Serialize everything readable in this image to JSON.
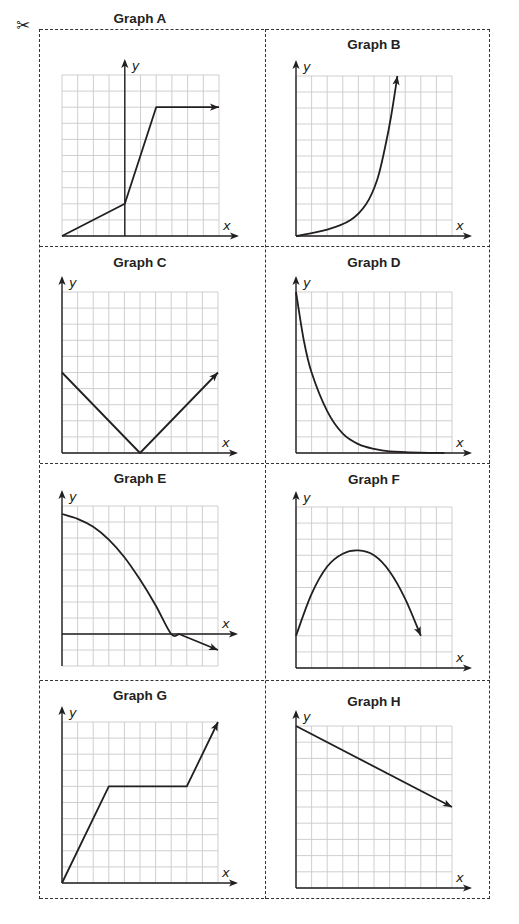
{
  "worksheet": {
    "cut_icon": "scissors-icon",
    "scissors_glyph": "✂",
    "colors": {
      "grid": "#c9c9c9",
      "axis": "#231f20",
      "curve": "#231f20",
      "cut_line": "#333333"
    }
  },
  "cards": [
    {
      "id": "A",
      "title": "Graph A",
      "x_label": "x",
      "y_label": "y"
    },
    {
      "id": "B",
      "title": "Graph B",
      "x_label": "x",
      "y_label": "y"
    },
    {
      "id": "C",
      "title": "Graph C",
      "x_label": "x",
      "y_label": "y"
    },
    {
      "id": "D",
      "title": "Graph D",
      "x_label": "x",
      "y_label": "y"
    },
    {
      "id": "E",
      "title": "Graph E",
      "x_label": "x",
      "y_label": "y"
    },
    {
      "id": "F",
      "title": "Graph F",
      "x_label": "x",
      "y_label": "y"
    },
    {
      "id": "G",
      "title": "Graph G",
      "x_label": "x",
      "y_label": "y"
    },
    {
      "id": "H",
      "title": "Graph H",
      "x_label": "x",
      "y_label": "y"
    }
  ],
  "chart_data": [
    {
      "title": "Graph A",
      "type": "line",
      "grid": {
        "cols": 10,
        "rows": 10
      },
      "y_axis_at_col": 4,
      "x_axis_at_row": 0,
      "points": [
        [
          0,
          0
        ],
        [
          4,
          2
        ],
        [
          6,
          8
        ],
        [
          10,
          8
        ]
      ],
      "arrow_end": true,
      "xlabel": "x",
      "ylabel": "y"
    },
    {
      "title": "Graph B",
      "type": "line",
      "shape": "exponential growth",
      "grid": {
        "cols": 10,
        "rows": 10
      },
      "y_axis_at_col": 0,
      "x_axis_at_row": 0,
      "points": [
        [
          0,
          0
        ],
        [
          2,
          0.4
        ],
        [
          3.5,
          1
        ],
        [
          4.5,
          2
        ],
        [
          5.2,
          3.5
        ],
        [
          5.7,
          5.5
        ],
        [
          6.1,
          7.5
        ],
        [
          6.5,
          10
        ]
      ],
      "arrow_end": true,
      "xlabel": "x",
      "ylabel": "y"
    },
    {
      "title": "Graph C",
      "type": "line",
      "shape": "absolute value (V)",
      "grid": {
        "cols": 10,
        "rows": 10
      },
      "y_axis_at_col": 0,
      "x_axis_at_row": 0,
      "points": [
        [
          0,
          5
        ],
        [
          5,
          0
        ],
        [
          10,
          5
        ]
      ],
      "arrow_end": true,
      "xlabel": "x",
      "ylabel": "y"
    },
    {
      "title": "Graph D",
      "type": "line",
      "shape": "exponential decay",
      "grid": {
        "cols": 10,
        "rows": 10
      },
      "y_axis_at_col": 0,
      "x_axis_at_row": 0,
      "points": [
        [
          0,
          10
        ],
        [
          0.5,
          7
        ],
        [
          1,
          5
        ],
        [
          2,
          2.6
        ],
        [
          3,
          1.2
        ],
        [
          4,
          0.55
        ],
        [
          5,
          0.25
        ],
        [
          6,
          0.1
        ],
        [
          8,
          0.02
        ],
        [
          9.5,
          0
        ]
      ],
      "arrow_end": false,
      "xlabel": "x",
      "ylabel": "y"
    },
    {
      "title": "Graph E",
      "type": "line",
      "shape": "decreasing concave-down then linear",
      "grid": {
        "cols": 10,
        "rows": 10
      },
      "y_axis_at_col": 0,
      "x_axis_at_row": 2,
      "points": [
        [
          0,
          9.5
        ],
        [
          1,
          9.2
        ],
        [
          2,
          8.7
        ],
        [
          3,
          7.9
        ],
        [
          4,
          6.8
        ],
        [
          5,
          5.4
        ],
        [
          6,
          3.8
        ],
        [
          7,
          2
        ],
        [
          7.5,
          2
        ],
        [
          10,
          1
        ]
      ],
      "y_offset_note": "rows measured from grid bottom; x-axis sits at row 2",
      "values_relative_to_axis": [
        [
          0,
          7.5
        ],
        [
          3,
          5.9
        ],
        [
          5,
          3.4
        ],
        [
          7.5,
          0
        ],
        [
          10,
          -1
        ]
      ],
      "arrow_end": true,
      "xlabel": "x",
      "ylabel": "y"
    },
    {
      "title": "Graph F",
      "type": "line",
      "shape": "parabola (opens down)",
      "grid": {
        "cols": 10,
        "rows": 10
      },
      "y_axis_at_col": 0,
      "x_axis_at_row": 0,
      "points": [
        [
          0,
          2
        ],
        [
          1,
          4.6
        ],
        [
          2,
          6.3
        ],
        [
          3,
          7.1
        ],
        [
          4,
          7.3
        ],
        [
          5,
          7
        ],
        [
          6,
          6
        ],
        [
          7,
          4.3
        ],
        [
          8,
          2
        ]
      ],
      "arrow_end": true,
      "xlabel": "x",
      "ylabel": "y"
    },
    {
      "title": "Graph G",
      "type": "line",
      "grid": {
        "cols": 10,
        "rows": 10
      },
      "y_axis_at_col": 0,
      "x_axis_at_row": 0,
      "points": [
        [
          0,
          0
        ],
        [
          3,
          6
        ],
        [
          8,
          6
        ],
        [
          10,
          10
        ]
      ],
      "arrow_end": true,
      "xlabel": "x",
      "ylabel": "y"
    },
    {
      "title": "Graph H",
      "type": "line",
      "grid": {
        "cols": 10,
        "rows": 10
      },
      "y_axis_at_col": 0,
      "x_axis_at_row": 0,
      "points": [
        [
          0,
          10
        ],
        [
          10,
          5
        ]
      ],
      "arrow_end": true,
      "xlabel": "x",
      "ylabel": "y"
    }
  ]
}
